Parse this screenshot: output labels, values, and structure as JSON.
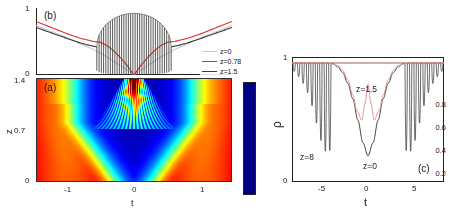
{
  "figure": {
    "background": "#ffffff",
    "colors": {
      "z0": "#c9c9d8",
      "z078": "#e03126",
      "z15": "#3a3a3a",
      "axis": "#222222",
      "text": "#1a1a1a"
    }
  },
  "panel_b": {
    "tag": "(b)",
    "ylabel": "power",
    "yticks": [
      "0",
      "1"
    ],
    "legend": [
      {
        "label": "z=0",
        "color": "#c9c9d8"
      },
      {
        "label": "z=0.78",
        "color": "#e03126"
      },
      {
        "label": "z=1.5",
        "color": "#3a3a3a"
      }
    ]
  },
  "panel_a": {
    "tag": "(a)",
    "xlabel": "t",
    "ylabel": "z",
    "xticks": [
      "-1",
      "0",
      "1"
    ],
    "yticks": [
      "0",
      "0.7",
      "1.4"
    ]
  },
  "colorbar": {
    "ticks": [
      "0.2",
      "0.4",
      "0.6",
      "0.8"
    ],
    "colormap": "jet"
  },
  "panel_c": {
    "tag": "(c)",
    "xlabel": "t",
    "ylabel": "ρ",
    "xticks": [
      "-5",
      "0",
      "5"
    ],
    "yticks": [
      "0",
      "1"
    ],
    "annotations": [
      {
        "label": "z=8",
        "color": "#3a3a3a"
      },
      {
        "label": "z=1.5",
        "color": "#1a1a1a"
      },
      {
        "label": "z=0",
        "color": "#1a1a1a"
      }
    ]
  },
  "chart_data": [
    {
      "type": "line",
      "panel": "(b)",
      "title": "",
      "xlabel": "",
      "ylabel": "power",
      "xlim": [
        -1.45,
        1.45
      ],
      "ylim": [
        0,
        1
      ],
      "xticks": [],
      "yticks": [
        0,
        1
      ],
      "grid": false,
      "legend_position": "right",
      "series": [
        {
          "name": "z=0",
          "color": "#c9c9d8",
          "description": "smooth V-shaped dip, minimum 0 at t=0, rising to ~0.74 at |t|=1.45",
          "x": [
            -1.45,
            -1.2,
            -1.0,
            -0.8,
            -0.6,
            -0.4,
            -0.2,
            0,
            0.2,
            0.4,
            0.6,
            0.8,
            1.0,
            1.2,
            1.45
          ],
          "y": [
            0.74,
            0.64,
            0.56,
            0.47,
            0.38,
            0.27,
            0.14,
            0.0,
            0.14,
            0.27,
            0.38,
            0.47,
            0.56,
            0.64,
            0.74
          ]
        },
        {
          "name": "z=0.78",
          "color": "#e03126",
          "description": "V-shaped dip with flattened shoulders near |t|~0.5, minimum 0 at t=0",
          "x": [
            -1.45,
            -1.2,
            -1.0,
            -0.8,
            -0.6,
            -0.5,
            -0.4,
            -0.3,
            -0.2,
            -0.1,
            0,
            0.1,
            0.2,
            0.3,
            0.4,
            0.5,
            0.6,
            0.8,
            1.0,
            1.2,
            1.45
          ],
          "y": [
            0.8,
            0.7,
            0.62,
            0.55,
            0.5,
            0.49,
            0.44,
            0.36,
            0.26,
            0.14,
            0.0,
            0.14,
            0.26,
            0.36,
            0.44,
            0.49,
            0.5,
            0.55,
            0.62,
            0.7,
            0.8
          ]
        },
        {
          "name": "z=1.5",
          "color": "#3a3a3a",
          "description": "smooth outer wings joined to a dense fast-oscillating region for |t|<0.55; oscillation envelope is a lens/ellipse rising to ~0.92 near t=0, oscillation troughs reach ~0.0",
          "oscillating_region": [
            -0.55,
            0.55
          ],
          "oscillation_count": 33,
          "envelope_peak": 0.92,
          "x": [
            -1.45,
            -1.2,
            -1.0,
            -0.8,
            -0.65,
            -0.55,
            0,
            0.55,
            0.65,
            0.8,
            1.0,
            1.2,
            1.45
          ],
          "y": [
            0.71,
            0.62,
            0.55,
            0.48,
            0.44,
            0.42,
            0.92,
            0.42,
            0.44,
            0.48,
            0.55,
            0.62,
            0.71
          ]
        }
      ]
    },
    {
      "type": "heatmap",
      "panel": "(a)",
      "title": "",
      "xlabel": "t",
      "ylabel": "z",
      "xlim": [
        -1.45,
        1.45
      ],
      "ylim": [
        0,
        1.4
      ],
      "xticks": [
        -1,
        0,
        1
      ],
      "yticks": [
        0,
        0.7,
        1.4
      ],
      "colormap": "jet",
      "zlim": [
        0,
        1
      ],
      "colorbar_ticks": [
        0.2,
        0.4,
        0.6,
        0.8
      ],
      "description": "Intensity map: high (red/orange ~0.95) at far left and right edges for all z; broad dark-blue low-value (~0.05) plume centered at t=0 widening with z up to z~0.75; above z~0.8 a narrow cone of vertical interference fringes converges toward t=0 with a red high-intensity spike at the top center near z=1.4"
    },
    {
      "type": "line",
      "panel": "(c)",
      "title": "",
      "xlabel": "t",
      "ylabel": "ρ",
      "xlim": [
        -7.5,
        7.5
      ],
      "ylim": [
        0,
        1.05
      ],
      "xticks": [
        -5,
        0,
        5
      ],
      "yticks": [
        0,
        1
      ],
      "grid": false,
      "series": [
        {
          "name": "z=0",
          "color": "#3a3a3a",
          "description": "smooth single deep well centered at t=0, minimum ~0.22, flat at 1 outside |t|>3.5",
          "x": [
            -7.5,
            -5,
            -4,
            -3.5,
            -3,
            -2.5,
            -2,
            -1.5,
            -1,
            -0.5,
            0,
            0.5,
            1,
            1.5,
            2,
            2.5,
            3,
            3.5,
            4,
            5,
            7.5
          ],
          "y": [
            1.0,
            1.0,
            1.0,
            0.995,
            0.97,
            0.92,
            0.83,
            0.7,
            0.52,
            0.33,
            0.22,
            0.33,
            0.52,
            0.7,
            0.83,
            0.92,
            0.97,
            0.995,
            1.0,
            1.0,
            1.0
          ]
        },
        {
          "name": "z=1.5",
          "color": "#e0918a",
          "description": "shallower well with a central secondary peak at t=0 (~0.82) flanked by two minima near t=-0.6 and t=+0.6 (~0.52), rising to 1 by |t|>3",
          "x": [
            -7.5,
            -4,
            -3,
            -2.5,
            -2,
            -1.5,
            -1.1,
            -0.6,
            -0.3,
            0,
            0.3,
            0.6,
            1.1,
            1.5,
            2,
            2.5,
            3,
            4,
            7.5
          ],
          "y": [
            1.0,
            1.0,
            0.98,
            0.94,
            0.86,
            0.73,
            0.6,
            0.52,
            0.66,
            0.82,
            0.66,
            0.52,
            0.6,
            0.73,
            0.86,
            0.94,
            0.98,
            1.0,
            1.0
          ]
        },
        {
          "name": "z=8",
          "color": "#3a3a3a",
          "description": "rapid oscillating fringes on both sides; spikes deepen toward |t|~5 (minima down to ~0.25) and shallow out toward |t|=7.5; flat near 1 in the central region |t|<3.5",
          "fringe_regions": [
            [
              -7.3,
              -3.6
            ],
            [
              3.6,
              7.3
            ]
          ],
          "fringe_count_per_side": 13,
          "deepest_minimum": 0.25
        }
      ]
    }
  ]
}
